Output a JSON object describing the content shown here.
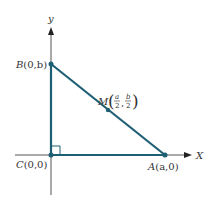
{
  "diagram": {
    "colors": {
      "axis": "#555555",
      "triangle": "#1e5f74",
      "text": "#333333"
    },
    "axes": {
      "x_label": "X",
      "y_label": "y"
    },
    "points": {
      "B": {
        "name": "B",
        "coords": "(0,b)"
      },
      "C": {
        "name": "C",
        "coords": "(0,0)"
      },
      "A": {
        "name": "A",
        "coords": "(a,0)"
      },
      "M": {
        "name": "M",
        "frac_x_num": "a",
        "frac_x_den": "2",
        "frac_y_num": "b",
        "frac_y_den": "2",
        "sep": ","
      }
    },
    "right_angle_marker": "C"
  }
}
